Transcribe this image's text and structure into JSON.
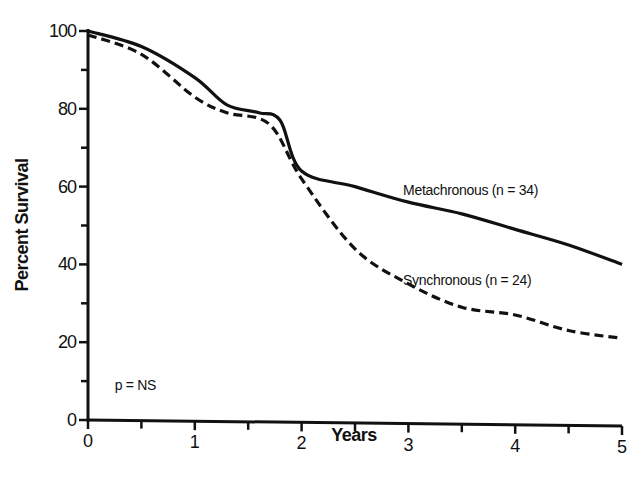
{
  "chart_data": {
    "type": "line",
    "title": "",
    "xlabel": "Years",
    "ylabel": "Percent Survival",
    "xlim": [
      0,
      5
    ],
    "ylim": [
      0,
      100
    ],
    "x_ticks": [
      0,
      1,
      2,
      3,
      4,
      5
    ],
    "x_minor_ticks": [
      0.5,
      1.5,
      2.5,
      3.5,
      4.5
    ],
    "y_ticks": [
      0,
      20,
      40,
      60,
      80,
      100
    ],
    "y_minor_ticks": [
      10,
      30,
      50,
      70,
      90
    ],
    "grid": false,
    "legend": "inline labels",
    "series": [
      {
        "name": "Metachronous (n = 34)",
        "style": "solid",
        "x": [
          0,
          0.5,
          1,
          1.3,
          1.6,
          1.8,
          2,
          2.5,
          3,
          3.5,
          4,
          4.5,
          5
        ],
        "values": [
          100,
          96,
          88,
          81,
          79,
          77,
          64,
          60,
          56,
          53,
          49,
          45,
          40
        ]
      },
      {
        "name": "Synchronous (n = 24)",
        "style": "dashed",
        "x": [
          0,
          0.5,
          1,
          1.3,
          1.7,
          2,
          2.5,
          3,
          3.5,
          4,
          4.5,
          5
        ],
        "values": [
          99,
          94,
          83,
          79,
          76,
          62,
          44,
          35,
          29,
          27,
          23,
          21
        ]
      }
    ],
    "annotations": [
      {
        "text": "Metachronous (n = 34)",
        "x": 2.95,
        "y": 59
      },
      {
        "text": "Synchronous (n = 24)",
        "x": 2.95,
        "y": 36
      },
      {
        "text": "p = NS",
        "x": 0.25,
        "y": 9
      }
    ]
  },
  "labels": {
    "xlabel": "Years",
    "ylabel": "Percent Survival",
    "metachronous": "Metachronous (n = 34)",
    "synchronous": "Synchronous (n = 24)",
    "pvalue": "p = NS"
  }
}
